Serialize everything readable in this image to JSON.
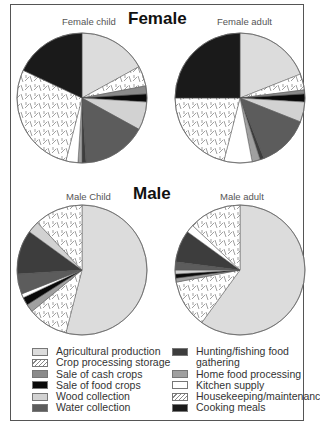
{
  "chart_data": [
    {
      "type": "pie",
      "title": "Female child",
      "group": "Female",
      "slices": [
        {
          "label": "Agricultural production",
          "value": 17
        },
        {
          "label": "Crop processing storage",
          "value": 5
        },
        {
          "label": "Sale of cash crops",
          "value": 2
        },
        {
          "label": "Sale of food crops",
          "value": 2
        },
        {
          "label": "Wood collection",
          "value": 7
        },
        {
          "label": "Water collection",
          "value": 16
        },
        {
          "label": "Hunting/fishing food gathering",
          "value": 1
        },
        {
          "label": "Home food processing",
          "value": 1
        },
        {
          "label": "Kitchen supply",
          "value": 3
        },
        {
          "label": "Housekeeping/maintenance",
          "value": 28
        },
        {
          "label": "Cooking meals",
          "value": 18
        }
      ]
    },
    {
      "type": "pie",
      "title": "Female adult",
      "group": "Female",
      "slices": [
        {
          "label": "Agricultural production",
          "value": 19
        },
        {
          "label": "Crop processing storage",
          "value": 4
        },
        {
          "label": "Sale of cash crops",
          "value": 1
        },
        {
          "label": "Sale of food crops",
          "value": 2
        },
        {
          "label": "Wood collection",
          "value": 5
        },
        {
          "label": "Water collection",
          "value": 13
        },
        {
          "label": "Hunting/fishing food gathering",
          "value": 1
        },
        {
          "label": "Home food processing",
          "value": 2
        },
        {
          "label": "Kitchen supply",
          "value": 7
        },
        {
          "label": "Housekeeping/maintenance",
          "value": 21
        },
        {
          "label": "Cooking meals",
          "value": 25
        }
      ]
    },
    {
      "type": "pie",
      "title": "Male Child",
      "group": "Male",
      "slices": [
        {
          "label": "Agricultural production",
          "value": 54
        },
        {
          "label": "Crop processing storage",
          "value": 10
        },
        {
          "label": "Home food processing",
          "value": 2
        },
        {
          "label": "Sale of food crops",
          "value": 2
        },
        {
          "label": "Kitchen supply",
          "value": 1
        },
        {
          "label": "Water collection",
          "value": 5
        },
        {
          "label": "Hunting/fishing food gathering",
          "value": 11
        },
        {
          "label": "Wood collection",
          "value": 3
        },
        {
          "label": "Housekeeping/maintenance",
          "value": 12
        }
      ]
    },
    {
      "type": "pie",
      "title": "Male adult",
      "group": "Male",
      "slices": [
        {
          "label": "Agricultural production",
          "value": 60
        },
        {
          "label": "Crop processing storage",
          "value": 12
        },
        {
          "label": "Home food processing",
          "value": 1
        },
        {
          "label": "Sale of food crops",
          "value": 1
        },
        {
          "label": "Wood collection",
          "value": 1
        },
        {
          "label": "Water collection",
          "value": 2
        },
        {
          "label": "Hunting/fishing food gathering",
          "value": 8
        },
        {
          "label": "Kitchen supply",
          "value": 2
        },
        {
          "label": "Housekeeping/maintenance",
          "value": 13
        }
      ]
    }
  ],
  "headings": {
    "female": "Female",
    "male": "Male"
  },
  "pie_labels": {
    "female_child": "Female child",
    "female_adult": "Female adult",
    "male_child": "Male Child",
    "male_adult": "Male adult"
  },
  "legend": {
    "left": [
      {
        "label": "Agricultural production",
        "fill": "#dcdcdc"
      },
      {
        "label": "Crop processing storage",
        "fill": "hatch"
      },
      {
        "label": "Sale of cash crops",
        "fill": "#8a8a8a"
      },
      {
        "label": "Sale of food crops",
        "fill": "#0a0a0a"
      },
      {
        "label": "Wood collection",
        "fill": "#d2d2d2"
      },
      {
        "label": "Water collection",
        "fill": "#5c5c5c"
      }
    ],
    "right": [
      {
        "label": "Hunting/fishing food",
        "label2": "gathering",
        "fill": "#3d3d3d"
      },
      {
        "label": "Home food processing",
        "fill": "#a0a0a0"
      },
      {
        "label": "Kitchen supply",
        "fill": "#ffffff"
      },
      {
        "label": "Housekeeping/maintenance",
        "fill": "hatch"
      },
      {
        "label": "Cooking meals",
        "fill": "#1a1a1a"
      }
    ]
  },
  "colors": {
    "Agricultural production": "#dcdcdc",
    "Crop processing storage": "hatch",
    "Sale of cash crops": "#8a8a8a",
    "Sale of food crops": "#0a0a0a",
    "Wood collection": "#d2d2d2",
    "Water collection": "#5c5c5c",
    "Hunting/fishing food gathering": "#3d3d3d",
    "Home food processing": "#a0a0a0",
    "Kitchen supply": "#ffffff",
    "Housekeeping/maintenance": "hatch",
    "Cooking meals": "#1a1a1a"
  }
}
